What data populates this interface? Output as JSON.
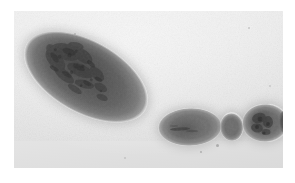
{
  "figure": {
    "media_type": "photograph",
    "tone": "grayscale",
    "subject_name": "segmented-specimen",
    "caption": "",
    "plate": {
      "background_color": "#e9e9e9",
      "margin_color": "#ffffff",
      "left": 14,
      "top": 11,
      "width": 269,
      "height": 157
    },
    "specimen": {
      "body_color": "#6e6e6e",
      "interior_color": "#3a3a3a",
      "halo_color": "#b4b4b4",
      "segment_count": 4,
      "orientation": "posterior-left to anterior-right",
      "segments": [
        {
          "id": "seg-body",
          "label": "large-posterior-segment",
          "shape": "ellipse",
          "rotation_deg": 29,
          "width": 136,
          "height": 72,
          "texture": "dark-mottled-interior"
        },
        {
          "id": "seg-mid",
          "label": "middle-segment",
          "shape": "ellipse",
          "rotation_deg": -2,
          "width": 64,
          "height": 38,
          "texture": "faint-streak"
        },
        {
          "id": "seg-small",
          "label": "small-segment",
          "shape": "ellipse",
          "rotation_deg": -3,
          "width": 24,
          "height": 29,
          "texture": "uniform"
        },
        {
          "id": "seg-head",
          "label": "anterior-head-segment",
          "shape": "bulbous",
          "rotation_deg": -2,
          "width": 46,
          "height": 38,
          "texture": "dark-apical-tip"
        }
      ]
    }
  }
}
